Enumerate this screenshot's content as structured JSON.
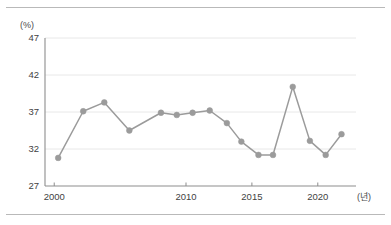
{
  "chart_data": {
    "type": "line",
    "title": "",
    "subtitle": "",
    "xlabel": "(년)",
    "ylabel": "(%)",
    "x": [
      2000,
      2001,
      2002,
      2003,
      2004,
      2005,
      2006,
      2007,
      2008,
      2009,
      2010,
      2011,
      2012,
      2013,
      2014,
      2015
    ],
    "values": [
      30.8,
      37.1,
      38.3,
      34.5,
      36.9,
      36.6,
      36.9,
      37.2,
      35.5,
      33.0,
      31.2,
      31.2,
      40.4,
      33.1,
      31.2,
      34.0
    ],
    "series": [
      {
        "name": "",
        "values": [
          30.8,
          37.1,
          38.3,
          34.5,
          36.9,
          36.6,
          36.9,
          37.2,
          35.5,
          33.0,
          31.2,
          31.2,
          40.4,
          33.1,
          31.2,
          34.0
        ]
      }
    ],
    "point_years": [
      2000.3,
      2002.2,
      2003.8,
      2005.7,
      2008.1,
      2009.3,
      2010.5,
      2011.8,
      2013.1,
      2014.2,
      2015.5,
      2016.6,
      2018.1,
      2019.4,
      2020.6,
      2021.8
    ],
    "ytick_labels": [
      "27",
      "32",
      "37",
      "42",
      "47"
    ],
    "ytick_values": [
      27,
      32,
      37,
      42,
      47
    ],
    "xtick_labels": [
      "2000",
      "2010",
      "2015",
      "2020"
    ],
    "xtick_values": [
      2000,
      2010,
      2015,
      2020
    ],
    "ylim": [
      27,
      47
    ],
    "xlim": [
      1999.3,
      2022.9
    ],
    "grid": "horizontal",
    "legend": "none",
    "line_color": "#9b9b9b",
    "marker_color": "#9b9b9b",
    "grid_color": "#e8e8e8",
    "axis_color": "#8d8d8d"
  },
  "frame": {
    "top_rule": "",
    "bottom_rule": ""
  }
}
